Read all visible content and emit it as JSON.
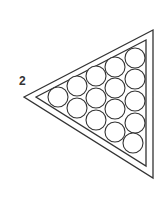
{
  "figure": {
    "label": "2",
    "ball_count": 15,
    "rows": 5,
    "stroke_color": "#333333",
    "fill_color": "#ffffff"
  }
}
